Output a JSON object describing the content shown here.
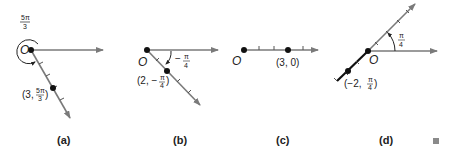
{
  "panels": [
    {
      "caption": "(a)",
      "origin_label": "O",
      "angle_label": {
        "num": "5π",
        "den": "3"
      },
      "point_label": {
        "prefix": "(3, ",
        "num": "5π",
        "den": "3",
        "suffix": ")"
      },
      "description": "Point (3, 5π/3) plotted via angle 5π/3 measured counterclockwise"
    },
    {
      "caption": "(b)",
      "origin_label": "O",
      "angle_label": {
        "sign": "−",
        "num": "π",
        "den": "4"
      },
      "point_label": {
        "prefix": "(2, −",
        "num": "π",
        "den": "4",
        "suffix": ")"
      },
      "description": "Point (2, −π/4) plotted via clockwise angle π/4"
    },
    {
      "caption": "(c)",
      "origin_label": "O",
      "point_label": {
        "text": "(3, 0)"
      },
      "description": "Point (3, 0) on polar axis"
    },
    {
      "caption": "(d)",
      "origin_label": "O",
      "angle_label": {
        "num": "π",
        "den": "4"
      },
      "point_label": {
        "prefix": "(−2, ",
        "num": "π",
        "den": "4",
        "suffix": ")"
      },
      "description": "Point (−2, π/4) plotted opposite the ray at angle π/4"
    }
  ],
  "colors": {
    "ray": "#7a7a7a",
    "point": "#111111",
    "neg_segment": "#111111",
    "marker_square": "#8a8a8a"
  }
}
